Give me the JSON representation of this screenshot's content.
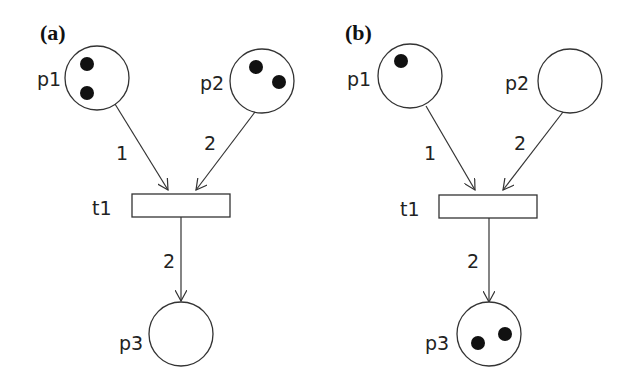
{
  "panels": [
    {
      "label": "(a)",
      "places": {
        "p1": {
          "name": "p1",
          "tokens": 2
        },
        "p2": {
          "name": "p2",
          "tokens": 2
        },
        "p3": {
          "name": "p3",
          "tokens": 0
        }
      },
      "transition": {
        "name": "t1"
      },
      "arcs": {
        "p1_t1": {
          "weight": "1"
        },
        "p2_t1": {
          "weight": "2"
        },
        "t1_p3": {
          "weight": "2"
        }
      }
    },
    {
      "label": "(b)",
      "places": {
        "p1": {
          "name": "p1",
          "tokens": 1
        },
        "p2": {
          "name": "p2",
          "tokens": 0
        },
        "p3": {
          "name": "p3",
          "tokens": 2
        }
      },
      "transition": {
        "name": "t1"
      },
      "arcs": {
        "p1_t1": {
          "weight": "1"
        },
        "p2_t1": {
          "weight": "2"
        },
        "t1_p3": {
          "weight": "2"
        }
      }
    }
  ],
  "colors": {
    "stroke": "#333333",
    "token": "#111111",
    "background": "#ffffff"
  }
}
